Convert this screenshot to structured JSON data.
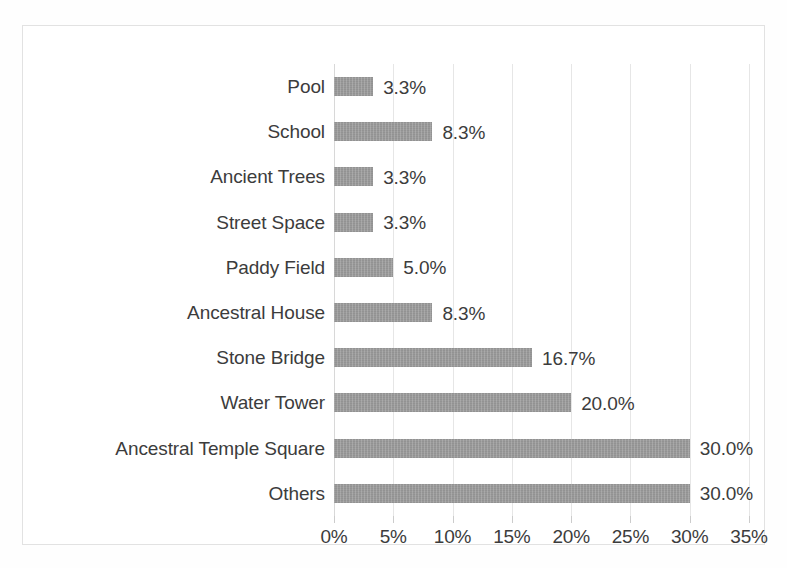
{
  "chart_data": {
    "type": "bar",
    "orientation": "horizontal",
    "title": "",
    "subtitle": "",
    "xlabel": "",
    "ylabel": "",
    "categories": [
      "Pool",
      "School",
      "Ancient Trees",
      "Street Space",
      "Paddy Field",
      "Ancestral House",
      "Stone Bridge",
      "Water Tower",
      "Ancestral Temple Square",
      "Others"
    ],
    "values": [
      3.3,
      8.3,
      3.3,
      3.3,
      5.0,
      8.3,
      16.7,
      20.0,
      30.0,
      30.0
    ],
    "data_labels": [
      "3.3%",
      "8.3%",
      "3.3%",
      "3.3%",
      "5.0%",
      "8.3%",
      "16.7%",
      "20.0%",
      "30.0%",
      "30.0%"
    ],
    "xlim": [
      0,
      35
    ],
    "xticks": [
      0,
      5,
      10,
      15,
      20,
      25,
      30,
      35
    ],
    "xtick_labels": [
      "0%",
      "5%",
      "10%",
      "15%",
      "20%",
      "25%",
      "30%",
      "35%"
    ],
    "grid": "vertical",
    "legend": "none",
    "bar_color": "#9a9a9a",
    "text_color": "#3c3c3c",
    "gridline_color": "#e6e6e6",
    "background_color": "#ffffff"
  }
}
